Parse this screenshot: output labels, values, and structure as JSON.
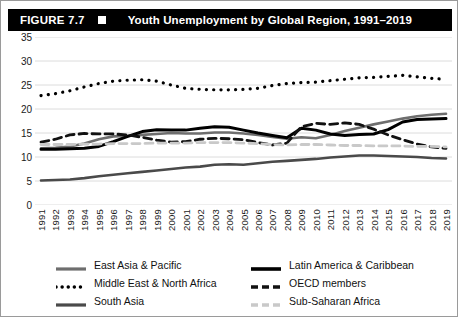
{
  "figure": {
    "number_label": "FIGURE 7.7",
    "marker_icon": "white-square-icon",
    "title": "Youth Unemployment by Global Region, 1991–2019"
  },
  "chart_data": {
    "type": "line",
    "title": "Youth Unemployment by Global Region, 1991–2019",
    "xlabel": "",
    "ylabel": "",
    "ylim": [
      0,
      35
    ],
    "ytick_step": 5,
    "yticks": [
      "35",
      "30",
      "25",
      "20",
      "15",
      "10",
      "5",
      "0"
    ],
    "grid": "horizontal",
    "legend_position": "bottom",
    "x": [
      "1991",
      "1992",
      "1993",
      "1994",
      "1995",
      "1996",
      "1997",
      "1998",
      "1999",
      "2000",
      "2001",
      "2002",
      "2003",
      "2004",
      "2005",
      "2006",
      "2007",
      "2008",
      "2009",
      "2010",
      "2011",
      "2012",
      "2013",
      "2014",
      "2015",
      "2016",
      "2017",
      "2018",
      "2019"
    ],
    "series": [
      {
        "name": "East Asia & Pacific",
        "style": "solid",
        "color": "#6e6e6e",
        "width": 2.6,
        "values": [
          11.8,
          11.9,
          12.2,
          12.8,
          13.7,
          14.3,
          14.4,
          14.6,
          14.8,
          15.0,
          14.9,
          14.9,
          15.1,
          15.1,
          14.9,
          14.6,
          14.2,
          13.8,
          14.1,
          13.9,
          14.6,
          15.4,
          16.1,
          16.8,
          17.4,
          18.0,
          18.5,
          18.8,
          19.0
        ]
      },
      {
        "name": "Latin America & Caribbean",
        "style": "solid",
        "color": "#000000",
        "width": 3.0,
        "values": [
          11.6,
          11.6,
          11.7,
          11.8,
          12.2,
          13.2,
          14.3,
          15.3,
          15.7,
          15.6,
          15.6,
          16.0,
          16.3,
          16.2,
          15.6,
          15.0,
          14.5,
          14.0,
          16.0,
          15.6,
          14.8,
          14.5,
          14.7,
          14.8,
          15.7,
          17.3,
          17.8,
          17.9,
          18.0
        ]
      },
      {
        "name": "Middle East & North Africa",
        "style": "dotted",
        "color": "#000000",
        "width": 2.6,
        "values": [
          22.8,
          23.2,
          23.8,
          24.6,
          25.3,
          25.8,
          26.0,
          26.1,
          25.8,
          25.0,
          24.3,
          24.1,
          24.0,
          24.0,
          24.1,
          24.3,
          24.9,
          25.3,
          25.5,
          25.6,
          25.9,
          26.2,
          26.5,
          26.6,
          26.8,
          27.0,
          26.7,
          26.4,
          26.2
        ]
      },
      {
        "name": "OECD members",
        "style": "dashed",
        "color": "#111111",
        "width": 2.8,
        "values": [
          13.1,
          13.7,
          14.6,
          14.9,
          14.8,
          14.8,
          14.6,
          14.1,
          13.5,
          13.1,
          13.2,
          13.7,
          13.9,
          13.8,
          13.6,
          13.0,
          12.5,
          12.9,
          16.3,
          17.0,
          16.8,
          17.1,
          16.8,
          15.8,
          14.6,
          13.6,
          12.7,
          12.1,
          11.8
        ]
      },
      {
        "name": "South Asia",
        "style": "solid",
        "color": "#4a4a4a",
        "width": 2.6,
        "values": [
          5.1,
          5.2,
          5.3,
          5.6,
          6.0,
          6.3,
          6.6,
          6.9,
          7.2,
          7.5,
          7.8,
          8.0,
          8.4,
          8.5,
          8.4,
          8.7,
          9.0,
          9.2,
          9.4,
          9.6,
          9.9,
          10.1,
          10.3,
          10.3,
          10.2,
          10.1,
          10.0,
          9.8,
          9.7
        ]
      },
      {
        "name": "Sub-Saharan Africa",
        "style": "dashed",
        "color": "#c9c9c9",
        "width": 2.8,
        "values": [
          12.6,
          12.6,
          12.6,
          12.7,
          12.7,
          12.8,
          12.8,
          12.8,
          12.9,
          12.9,
          12.9,
          13.0,
          13.0,
          13.0,
          12.9,
          12.8,
          12.6,
          12.5,
          12.6,
          12.6,
          12.5,
          12.4,
          12.4,
          12.3,
          12.3,
          12.3,
          12.2,
          12.2,
          12.1
        ]
      }
    ]
  }
}
